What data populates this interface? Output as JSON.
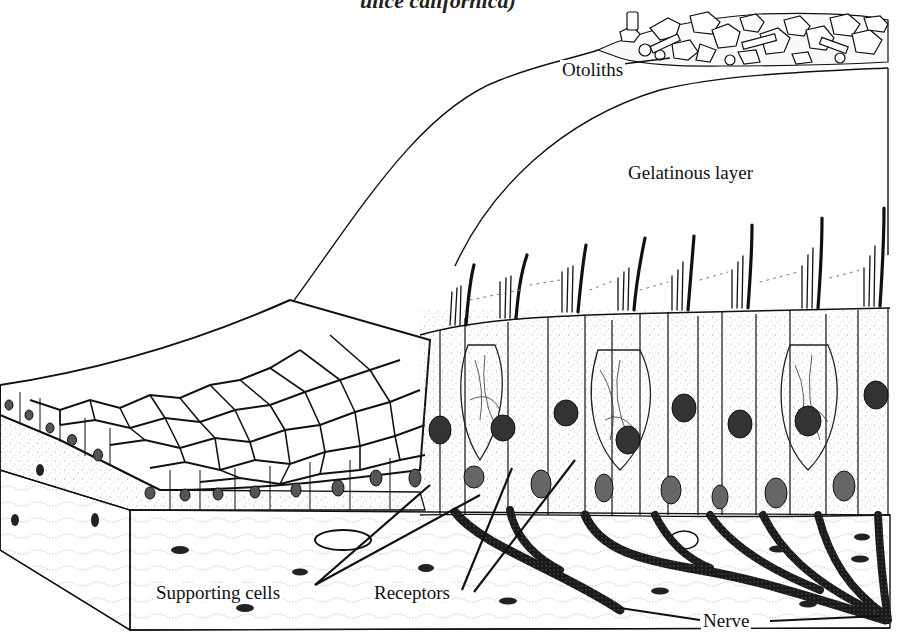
{
  "figure": {
    "title_fragment": "ulice californica)",
    "labels": {
      "otoliths": "Otoliths",
      "gelatinous_layer": "Gelatinous layer",
      "supporting_cells": "Supporting cells",
      "receptors": "Receptors",
      "nerve": "Nerve"
    },
    "colors": {
      "ink": "#111111",
      "paper": "#ffffff",
      "stipple": "#9a9a9a",
      "nucleus": "#3a3a3a"
    }
  }
}
